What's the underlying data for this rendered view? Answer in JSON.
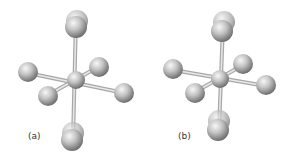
{
  "figure": {
    "colors": {
      "atom_light": "#e6e6e6",
      "atom_mid": "#b3b3b3",
      "atom_dark": "#6e6e6e",
      "bond": "#c8c8c8",
      "label": "#333333"
    },
    "panels": [
      {
        "id": "a",
        "label": "(a)",
        "axial_atoms": "displaced-double",
        "equatorial_atoms": 4,
        "central_atom": 1
      },
      {
        "id": "b",
        "label": "(b)",
        "axial_atoms": "displaced-double",
        "equatorial_atoms": 4,
        "central_atom": 1
      }
    ]
  }
}
